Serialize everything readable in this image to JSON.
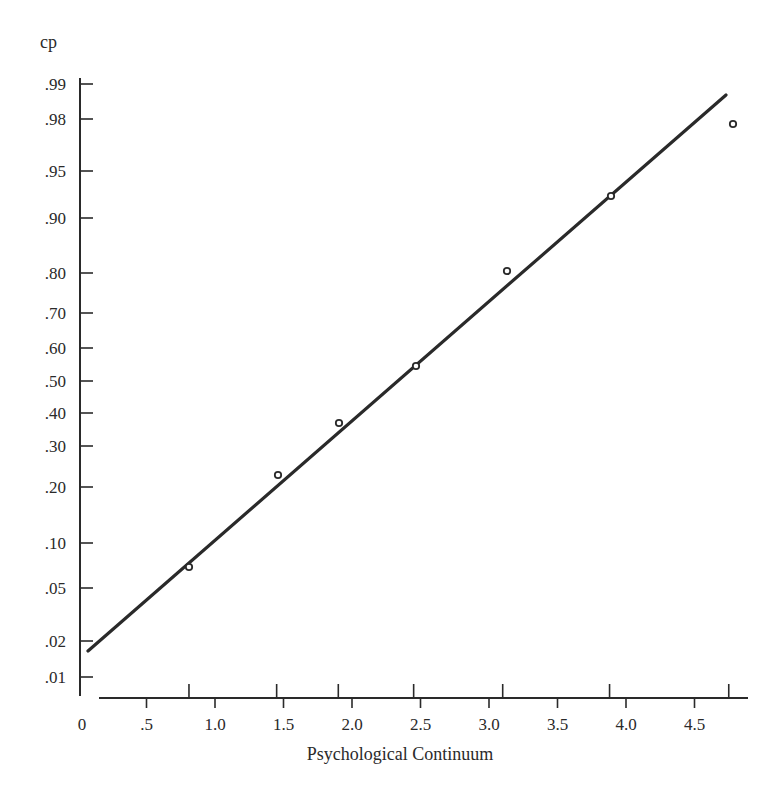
{
  "chart_data": {
    "type": "scatter",
    "title": "",
    "xlabel": "Psychological Continuum",
    "ylabel": "cp",
    "x_scale": "linear",
    "y_scale": "normal-probability",
    "xlim": [
      0,
      4.85
    ],
    "ylim": [
      0.008,
      0.992
    ],
    "grid": false,
    "legend": null,
    "x_ticks": [
      {
        "value": 0,
        "label": "0"
      },
      {
        "value": 0.5,
        "label": ".5"
      },
      {
        "value": 1.0,
        "label": "1.0"
      },
      {
        "value": 1.5,
        "label": "1.5"
      },
      {
        "value": 2.0,
        "label": "2.0"
      },
      {
        "value": 2.5,
        "label": "2.5"
      },
      {
        "value": 3.0,
        "label": "3.0"
      },
      {
        "value": 3.5,
        "label": "3.5"
      },
      {
        "value": 4.0,
        "label": "4.0"
      },
      {
        "value": 4.5,
        "label": "4.5"
      }
    ],
    "y_ticks": [
      {
        "value": 0.99,
        "label": ".99"
      },
      {
        "value": 0.98,
        "label": ".98"
      },
      {
        "value": 0.95,
        "label": ".95"
      },
      {
        "value": 0.9,
        "label": ".90"
      },
      {
        "value": 0.8,
        "label": ".80"
      },
      {
        "value": 0.7,
        "label": ".70"
      },
      {
        "value": 0.6,
        "label": ".60"
      },
      {
        "value": 0.5,
        "label": ".50"
      },
      {
        "value": 0.4,
        "label": ".40"
      },
      {
        "value": 0.3,
        "label": ".30"
      },
      {
        "value": 0.2,
        "label": ".20"
      },
      {
        "value": 0.1,
        "label": ".10"
      },
      {
        "value": 0.05,
        "label": ".05"
      },
      {
        "value": 0.02,
        "label": ".02"
      },
      {
        "value": 0.01,
        "label": ".01"
      }
    ],
    "stimulus_ticks_x": [
      0.81,
      1.45,
      1.9,
      2.45,
      3.1,
      3.88,
      4.75
    ],
    "series": [
      {
        "name": "observed",
        "marker": "open-circle",
        "points": [
          {
            "x": 0.81,
            "y": 0.07
          },
          {
            "x": 1.46,
            "y": 0.23
          },
          {
            "x": 1.91,
            "y": 0.37
          },
          {
            "x": 2.47,
            "y": 0.55
          },
          {
            "x": 3.13,
            "y": 0.81
          },
          {
            "x": 3.89,
            "y": 0.925
          },
          {
            "x": 4.78,
            "y": 0.978
          }
        ]
      },
      {
        "name": "fitted line",
        "marker": "none",
        "line": true,
        "points": [
          {
            "x": 0.07,
            "y": 0.017
          },
          {
            "x": 4.73,
            "y": 0.988
          }
        ]
      }
    ]
  },
  "layout": {
    "ink": "#2a2a2a",
    "y_axis_x": 80,
    "y_axis_top": 78,
    "y_axis_bottom": 696,
    "x_axis_y": 698,
    "x_axis_left": 99,
    "x_axis_right": 748,
    "x_origin_px": 78,
    "x_px_per_unit": 137,
    "y_tick_px": {
      "0.99": 84,
      "0.98": 119,
      "0.95": 171,
      "0.90": 218,
      "0.80": 273,
      "0.70": 313,
      "0.60": 348,
      "0.50": 381,
      "0.40": 413,
      "0.30": 446,
      "0.20": 487,
      "0.10": 543,
      "0.05": 588,
      "0.02": 641,
      "0.01": 677
    },
    "point_px": [
      [
        189,
        567
      ],
      [
        278,
        475
      ],
      [
        339,
        423
      ],
      [
        416,
        366
      ],
      [
        507,
        271
      ],
      [
        611,
        196
      ],
      [
        733,
        124
      ]
    ],
    "line_px": [
      [
        88,
        651
      ],
      [
        726,
        95
      ]
    ]
  }
}
